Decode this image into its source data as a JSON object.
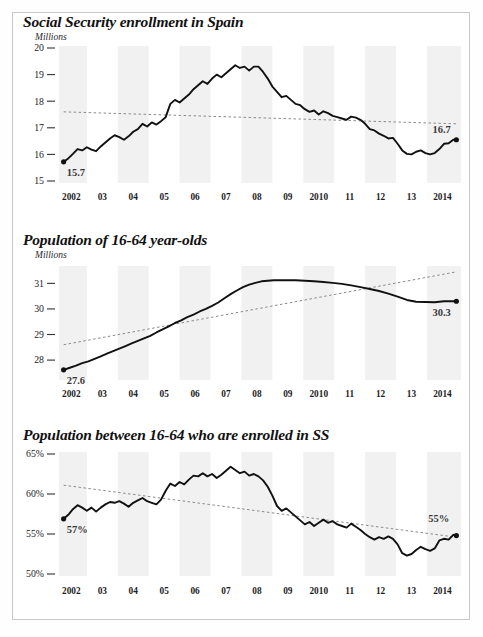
{
  "figure": {
    "background_color": "#ffffff",
    "border_color": "#c9c9c9",
    "band_color": "#f1f1f1",
    "line_color": "#111111",
    "trend_color": "#8a8a8a"
  },
  "panels": [
    {
      "id": "social-security-enrollment",
      "title": "Social Security enrollment in Spain",
      "unit": "Millions",
      "start_label": "15.7",
      "end_label": "16.7"
    },
    {
      "id": "population-16-64",
      "title": "Population of 16-64 year-olds",
      "unit": "Millions",
      "start_label": "27.6",
      "end_label": "30.3"
    },
    {
      "id": "share-enrolled",
      "title": "Population between 16-64 who are enrolled in SS",
      "unit": "",
      "start_label": "57%",
      "end_label": "55%"
    }
  ],
  "chart_data": [
    {
      "type": "line",
      "title": "Social Security enrollment in Spain",
      "ylabel": "Millions",
      "xlabel": "",
      "ylim": [
        15,
        20
      ],
      "yticks": [
        20,
        19,
        18,
        17,
        16,
        15
      ],
      "ytick_labels": [
        "20",
        "19",
        "18",
        "17",
        "16",
        "15"
      ],
      "xlim": [
        2001.6,
        2014.6
      ],
      "xticks": [
        2002,
        2003,
        2004,
        2005,
        2006,
        2007,
        2008,
        2009,
        2010,
        2011,
        2012,
        2013,
        2014
      ],
      "xtick_labels": [
        "2002",
        "03",
        "04",
        "05",
        "06",
        "07",
        "08",
        "09",
        "2010",
        "11",
        "12",
        "13",
        "2014"
      ],
      "grid": false,
      "shaded_bands": [
        [
          2001.6,
          2002.5
        ],
        [
          2003.5,
          2004.5
        ],
        [
          2005.5,
          2006.5
        ],
        [
          2007.5,
          2008.5
        ],
        [
          2009.5,
          2010.5
        ],
        [
          2011.5,
          2012.5
        ],
        [
          2013.5,
          2014.6
        ]
      ],
      "annotations": [
        {
          "text": "15.7",
          "x": 2001.75,
          "y": 15.7
        },
        {
          "text": "16.7",
          "x": 2014.4,
          "y": 16.55
        }
      ],
      "series": [
        {
          "name": "Social Security enrollment",
          "x": [
            2001.75,
            2001.9,
            2002.05,
            2002.2,
            2002.35,
            2002.5,
            2002.65,
            2002.8,
            2002.95,
            2003.1,
            2003.25,
            2003.4,
            2003.55,
            2003.7,
            2003.85,
            2004.0,
            2004.15,
            2004.3,
            2004.45,
            2004.6,
            2004.75,
            2004.9,
            2005.05,
            2005.2,
            2005.35,
            2005.5,
            2005.65,
            2005.8,
            2005.95,
            2006.1,
            2006.25,
            2006.4,
            2006.55,
            2006.7,
            2006.85,
            2007.0,
            2007.15,
            2007.3,
            2007.45,
            2007.6,
            2007.75,
            2007.9,
            2008.05,
            2008.2,
            2008.35,
            2008.5,
            2008.65,
            2008.8,
            2008.95,
            2009.1,
            2009.25,
            2009.4,
            2009.55,
            2009.7,
            2009.85,
            2010.0,
            2010.15,
            2010.3,
            2010.45,
            2010.6,
            2010.75,
            2010.9,
            2011.05,
            2011.2,
            2011.35,
            2011.5,
            2011.65,
            2011.8,
            2011.95,
            2012.1,
            2012.25,
            2012.4,
            2012.55,
            2012.7,
            2012.85,
            2013.0,
            2013.15,
            2013.3,
            2013.45,
            2013.6,
            2013.75,
            2013.9,
            2014.05,
            2014.2,
            2014.35,
            2014.45
          ],
          "y": [
            15.72,
            15.85,
            16.02,
            16.2,
            16.15,
            16.27,
            16.18,
            16.12,
            16.3,
            16.45,
            16.6,
            16.72,
            16.65,
            16.55,
            16.68,
            16.85,
            16.95,
            17.15,
            17.05,
            17.2,
            17.12,
            17.25,
            17.4,
            17.9,
            18.05,
            17.95,
            18.1,
            18.25,
            18.45,
            18.6,
            18.75,
            18.65,
            18.85,
            19.0,
            18.9,
            19.05,
            19.2,
            19.35,
            19.25,
            19.3,
            19.15,
            19.3,
            19.3,
            19.1,
            18.85,
            18.55,
            18.35,
            18.15,
            18.2,
            18.05,
            17.9,
            17.85,
            17.7,
            17.6,
            17.65,
            17.5,
            17.62,
            17.55,
            17.45,
            17.4,
            17.35,
            17.3,
            17.42,
            17.38,
            17.3,
            17.15,
            16.95,
            16.9,
            16.78,
            16.7,
            16.6,
            16.62,
            16.4,
            16.15,
            16.02,
            16.0,
            16.1,
            16.15,
            16.05,
            16.0,
            16.05,
            16.2,
            16.4,
            16.42,
            16.55,
            16.55
          ]
        }
      ],
      "trend": {
        "x": [
          2001.75,
          2014.45
        ],
        "y": [
          17.6,
          17.15
        ],
        "style": "dashed"
      }
    },
    {
      "type": "line",
      "title": "Population of 16-64 year-olds",
      "ylabel": "Millions",
      "xlabel": "",
      "ylim": [
        27.3,
        31.6
      ],
      "yticks": [
        31,
        30,
        29,
        28
      ],
      "ytick_labels": [
        "31",
        "30",
        "29",
        "28"
      ],
      "xlim": [
        2001.6,
        2014.6
      ],
      "xticks": [
        2002,
        2003,
        2004,
        2005,
        2006,
        2007,
        2008,
        2009,
        2010,
        2011,
        2012,
        2013,
        2014
      ],
      "xtick_labels": [
        "2002",
        "03",
        "04",
        "05",
        "06",
        "07",
        "08",
        "09",
        "2010",
        "11",
        "12",
        "13",
        "2014"
      ],
      "grid": false,
      "shaded_bands": [
        [
          2001.6,
          2002.5
        ],
        [
          2003.5,
          2004.5
        ],
        [
          2005.5,
          2006.5
        ],
        [
          2007.5,
          2008.5
        ],
        [
          2009.5,
          2010.5
        ],
        [
          2011.5,
          2012.5
        ],
        [
          2013.5,
          2014.6
        ]
      ],
      "annotations": [
        {
          "text": "27.6",
          "x": 2001.75,
          "y": 27.6
        },
        {
          "text": "30.3",
          "x": 2014.4,
          "y": 30.3
        }
      ],
      "series": [
        {
          "name": "Population 16-64",
          "x": [
            2001.75,
            2001.95,
            2002.15,
            2002.35,
            2002.55,
            2002.75,
            2002.95,
            2003.15,
            2003.35,
            2003.55,
            2003.75,
            2003.95,
            2004.15,
            2004.35,
            2004.55,
            2004.75,
            2004.95,
            2005.15,
            2005.35,
            2005.55,
            2005.75,
            2005.95,
            2006.15,
            2006.35,
            2006.55,
            2006.75,
            2006.95,
            2007.15,
            2007.35,
            2007.55,
            2007.75,
            2007.95,
            2008.15,
            2008.35,
            2008.55,
            2008.75,
            2008.95,
            2009.25,
            2009.55,
            2009.85,
            2010.15,
            2010.45,
            2010.75,
            2011.05,
            2011.35,
            2011.65,
            2011.95,
            2012.25,
            2012.55,
            2012.85,
            2013.15,
            2013.45,
            2013.75,
            2014.05,
            2014.45
          ],
          "y": [
            27.62,
            27.7,
            27.78,
            27.88,
            27.95,
            28.05,
            28.15,
            28.25,
            28.35,
            28.45,
            28.55,
            28.65,
            28.75,
            28.85,
            28.95,
            29.08,
            29.2,
            29.32,
            29.45,
            29.55,
            29.68,
            29.78,
            29.9,
            30.0,
            30.12,
            30.25,
            30.42,
            30.58,
            30.72,
            30.85,
            30.95,
            31.02,
            31.08,
            31.1,
            31.12,
            31.12,
            31.12,
            31.12,
            31.1,
            31.08,
            31.05,
            31.02,
            30.98,
            30.92,
            30.85,
            30.78,
            30.7,
            30.6,
            30.48,
            30.35,
            30.28,
            30.27,
            30.26,
            30.3,
            30.3
          ]
        }
      ],
      "trend": {
        "x": [
          2001.75,
          2014.45
        ],
        "y": [
          28.6,
          31.45
        ],
        "style": "dashed"
      }
    },
    {
      "type": "line",
      "title": "Population between 16-64 who are enrolled in SS",
      "ylabel": "",
      "xlabel": "",
      "ylim": [
        50,
        65
      ],
      "yticks": [
        65,
        60,
        55,
        50
      ],
      "ytick_labels": [
        "65%",
        "60%",
        "55%",
        "50%"
      ],
      "xlim": [
        2001.6,
        2014.6
      ],
      "xticks": [
        2002,
        2003,
        2004,
        2005,
        2006,
        2007,
        2008,
        2009,
        2010,
        2011,
        2012,
        2013,
        2014
      ],
      "xtick_labels": [
        "2002",
        "03",
        "04",
        "05",
        "06",
        "07",
        "08",
        "09",
        "2010",
        "11",
        "12",
        "13",
        "2014"
      ],
      "grid": false,
      "shaded_bands": [
        [
          2001.6,
          2002.5
        ],
        [
          2003.5,
          2004.5
        ],
        [
          2005.5,
          2006.5
        ],
        [
          2007.5,
          2008.5
        ],
        [
          2009.5,
          2010.5
        ],
        [
          2011.5,
          2012.5
        ],
        [
          2013.5,
          2014.6
        ]
      ],
      "annotations": [
        {
          "text": "57%",
          "x": 2001.75,
          "y": 56.9
        },
        {
          "text": "55%",
          "x": 2014.35,
          "y": 55.6
        }
      ],
      "series": [
        {
          "name": "Share of 16-64 enrolled in SS",
          "x": [
            2001.75,
            2001.9,
            2002.05,
            2002.2,
            2002.35,
            2002.5,
            2002.65,
            2002.8,
            2002.95,
            2003.1,
            2003.25,
            2003.4,
            2003.55,
            2003.7,
            2003.85,
            2004.0,
            2004.15,
            2004.3,
            2004.45,
            2004.6,
            2004.75,
            2004.9,
            2005.05,
            2005.2,
            2005.35,
            2005.5,
            2005.65,
            2005.8,
            2005.95,
            2006.1,
            2006.25,
            2006.4,
            2006.55,
            2006.7,
            2006.85,
            2007.0,
            2007.15,
            2007.3,
            2007.45,
            2007.6,
            2007.75,
            2007.9,
            2008.05,
            2008.2,
            2008.35,
            2008.5,
            2008.65,
            2008.8,
            2008.95,
            2009.1,
            2009.25,
            2009.4,
            2009.55,
            2009.7,
            2009.85,
            2010.0,
            2010.15,
            2010.3,
            2010.45,
            2010.6,
            2010.75,
            2010.9,
            2011.05,
            2011.2,
            2011.35,
            2011.5,
            2011.65,
            2011.8,
            2011.95,
            2012.1,
            2012.25,
            2012.4,
            2012.55,
            2012.7,
            2012.85,
            2013.0,
            2013.15,
            2013.3,
            2013.45,
            2013.6,
            2013.75,
            2013.9,
            2014.05,
            2014.2,
            2014.35,
            2014.45
          ],
          "y": [
            56.9,
            57.4,
            58.1,
            58.6,
            58.3,
            57.9,
            58.3,
            57.8,
            58.3,
            58.7,
            59.0,
            58.9,
            59.1,
            58.8,
            58.4,
            58.9,
            59.2,
            59.5,
            59.1,
            58.9,
            58.7,
            59.3,
            60.4,
            61.3,
            61.0,
            61.5,
            61.2,
            61.8,
            62.3,
            62.2,
            62.6,
            62.2,
            62.5,
            62.0,
            62.4,
            62.9,
            63.4,
            63.0,
            62.6,
            62.8,
            62.3,
            62.5,
            62.2,
            61.7,
            60.9,
            59.8,
            58.5,
            57.9,
            58.2,
            57.7,
            57.2,
            56.7,
            56.2,
            56.5,
            56.0,
            56.4,
            56.8,
            56.4,
            56.6,
            56.2,
            56.0,
            55.8,
            56.3,
            55.9,
            55.5,
            55.0,
            54.6,
            54.3,
            54.6,
            54.4,
            54.7,
            54.4,
            53.7,
            52.6,
            52.3,
            52.5,
            53.0,
            53.4,
            53.1,
            52.9,
            53.2,
            54.2,
            54.4,
            54.3,
            54.9,
            54.8
          ]
        }
      ],
      "trend": {
        "x": [
          2001.75,
          2014.45
        ],
        "y": [
          61.1,
          54.6
        ],
        "style": "dashed"
      }
    }
  ]
}
